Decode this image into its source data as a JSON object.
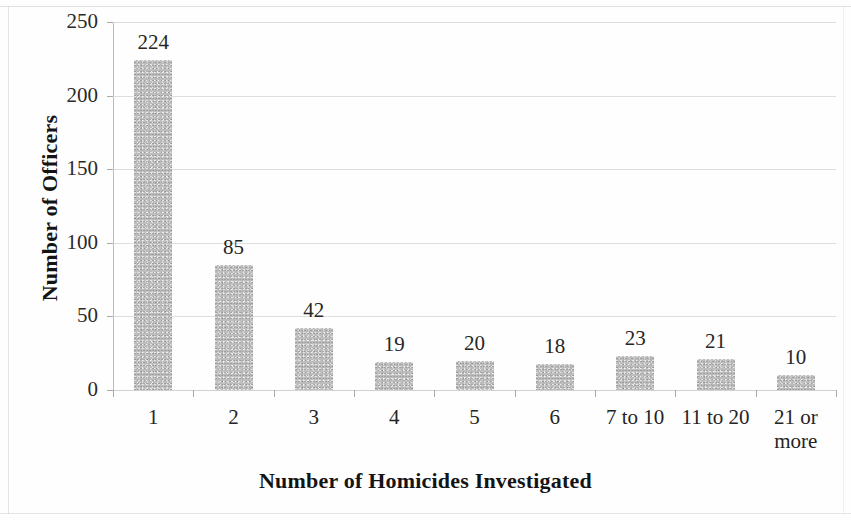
{
  "chart_data": {
    "type": "bar",
    "title": "",
    "subtitle": "",
    "xlabel": "Number of Homicides Investigated",
    "ylabel": "Number of Officers",
    "categories": [
      "1",
      "2",
      "3",
      "4",
      "5",
      "6",
      "7 to 10",
      "11 to 20",
      "21 or\nmore"
    ],
    "values": [
      224,
      85,
      42,
      19,
      20,
      18,
      23,
      21,
      10
    ],
    "data_labels": [
      "224",
      "85",
      "42",
      "19",
      "20",
      "18",
      "23",
      "21",
      "10"
    ],
    "ylim": [
      0,
      250
    ],
    "ytick_values": [
      0,
      50,
      100,
      150,
      200,
      250
    ],
    "ytick_labels": [
      "0",
      "50",
      "100",
      "150",
      "200",
      "250"
    ],
    "grid": "horizontal",
    "legend": "none",
    "bar_color": "#bdbdbd",
    "gridline_color": "#d8d8d8",
    "axis_color": "#a9a9a9",
    "text_color": "#242424"
  }
}
